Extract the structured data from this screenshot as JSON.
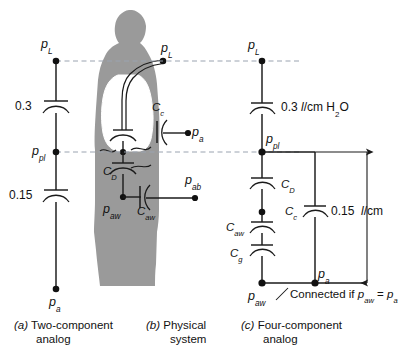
{
  "figure": {
    "colors": {
      "silhouette": "#9a9a9a",
      "lung": "#ffffff",
      "line": "#1a1a1a",
      "dashed": "#9aa3b0"
    }
  },
  "panel_a": {
    "caption_index": "(a)",
    "caption_line1": "Two-component",
    "caption_line2": "analog",
    "nodes": [
      {
        "name": "p-L",
        "label_base": "p",
        "label_sub": "L"
      },
      {
        "name": "p-pl",
        "label_base": "p",
        "label_sub": "pl"
      },
      {
        "name": "p-a",
        "label_base": "p",
        "label_sub": "a"
      }
    ],
    "capacitors": [
      {
        "name": "upper",
        "value": "0.3"
      },
      {
        "name": "lower",
        "value": "0.15"
      }
    ]
  },
  "panel_b": {
    "caption_index": "(b)",
    "caption_line1": "Physical",
    "caption_line2": "system",
    "labels": [
      {
        "name": "Cc",
        "base": "C",
        "sub": "c"
      },
      {
        "name": "CD",
        "base": "C",
        "sub": "D"
      },
      {
        "name": "Caw",
        "base": "C",
        "sub": "aw"
      },
      {
        "name": "p-L",
        "base": "p",
        "sub": "L"
      },
      {
        "name": "p-a",
        "base": "p",
        "sub": "a"
      },
      {
        "name": "p-ab",
        "base": "p",
        "sub": "ab"
      },
      {
        "name": "p-aw",
        "base": "p",
        "sub": "aw"
      }
    ]
  },
  "panel_c": {
    "caption_index": "(c)",
    "caption_line1": "Four-component",
    "caption_line2": "analog",
    "compliance_top": {
      "value": "0.3",
      "unit_italic": "l",
      "unit_rest": "/cm H",
      "unit_sub": "2",
      "unit_tail": "O"
    },
    "dimension": {
      "value": "0.15",
      "unit_italic": "l",
      "unit_rest": "/cm"
    },
    "capacitors": [
      {
        "name": "C-D",
        "base": "C",
        "sub": "D"
      },
      {
        "name": "C-aw",
        "base": "C",
        "sub": "aw"
      },
      {
        "name": "C-g",
        "base": "C",
        "sub": "g"
      },
      {
        "name": "C-c",
        "base": "C",
        "sub": "c"
      }
    ],
    "nodes": [
      {
        "name": "p-L",
        "base": "p",
        "sub": "L"
      },
      {
        "name": "p-pl",
        "base": "p",
        "sub": "pl"
      },
      {
        "name": "p-aw",
        "base": "p",
        "sub": "aw"
      },
      {
        "name": "p-a",
        "base": "p",
        "sub": "a"
      }
    ],
    "note": {
      "text_lead": "Connected if ",
      "eq_left_base": "p",
      "eq_left_sub": "aw",
      "eq_mid": " = ",
      "eq_right_base": "p",
      "eq_right_sub": "a"
    }
  }
}
